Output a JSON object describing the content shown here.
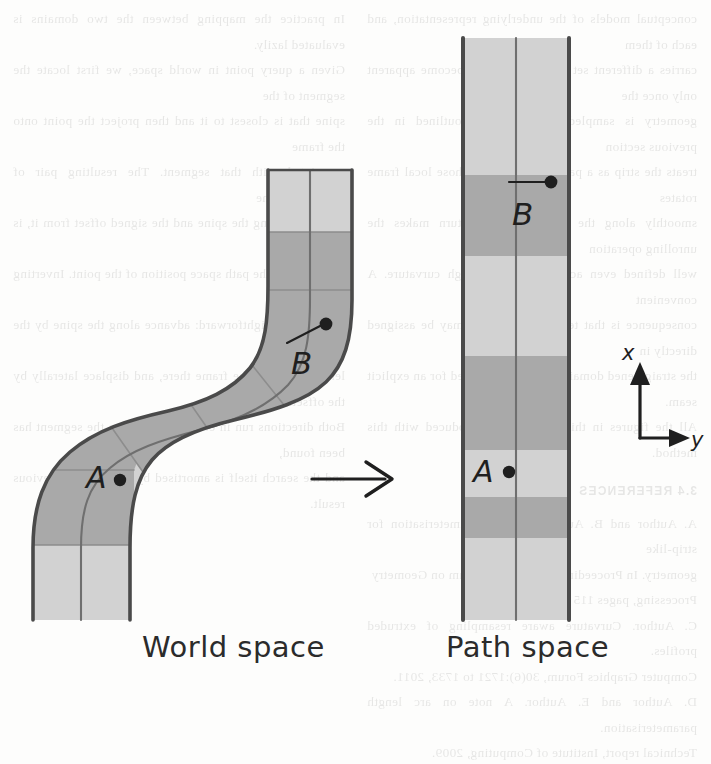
{
  "figure": {
    "title_left": "World space",
    "title_right": "Path space",
    "transform_arrow": "right-arrow",
    "axes": {
      "vertical_label": "x",
      "horizontal_label": "y"
    },
    "points": [
      {
        "id": "A",
        "label": "A",
        "space": "world",
        "x": 120,
        "y": 480
      },
      {
        "id": "B",
        "label": "B",
        "space": "world",
        "x": 325,
        "y": 324
      },
      {
        "id": "A",
        "label": "A",
        "space": "path",
        "x": 509,
        "y": 472
      },
      {
        "id": "B",
        "label": "B",
        "space": "path",
        "x": 551,
        "y": 183
      }
    ],
    "colors": {
      "band_light": "#d2d2d2",
      "band_dark": "#a9a9a9",
      "outline": "#4a4a4a",
      "centerline": "#6f6f6f",
      "ink": "#2b2b2b",
      "paper": "#fdfdfc"
    },
    "path_space": {
      "left_edge_x": 462,
      "right_edge_x": 570,
      "center_x": 516,
      "top_y": 38,
      "bottom_y": 620,
      "bands": [
        {
          "shade": "light",
          "from": 38,
          "to": 175
        },
        {
          "shade": "dark",
          "from": 175,
          "to": 256
        },
        {
          "shade": "light",
          "from": 256,
          "to": 356
        },
        {
          "shade": "dark",
          "from": 356,
          "to": 450
        },
        {
          "shade": "light",
          "from": 450,
          "to": 497
        },
        {
          "shade": "dark",
          "from": 497,
          "to": 538
        },
        {
          "shade": "light",
          "from": 538,
          "to": 620
        }
      ]
    },
    "world_space": {
      "description": "curved S-shaped ribbon with alternating light and dark segments",
      "segment_count": 7
    }
  },
  "ghost_text": {
    "left": [
      "conceptual models of the underlying representation, and each of them",
      "carries a different set of trade-offs that become apparent only once the",
      "geometry is sampled. The approach outlined in the previous section",
      "treats the strip as a parametric surface whose local frame rotates",
      "smoothly along the spine, which in turn makes the unrolling operation",
      "well defined even across regions of high curvature. A convenient",
      "consequence is that texture coordinates may be assigned directly in",
      "the straightened domain, removing the need for an explicit seam.",
      "All the figures in this chapter were produced with this method."
    ],
    "left_head": "3.4 REFERENCES",
    "left_tail": [
      "A. Author and B. Author. Surface parameterisation for strip-like",
      "  geometry. In Proceedings of the Symposium on Geometry",
      "  Processing, pages 115 to 124, 2011.",
      "C. Author. Curvature aware resampling of extruded profiles.",
      "  Computer Graphics Forum, 30(6):1721 to 1733, 2011.",
      "D. Author and E. Author. A note on arc length parameterisation.",
      "  Technical report, Institute of Computing, 2009."
    ],
    "right": [
      "In practice the mapping between the two domains is evaluated lazily.",
      "Given a query point in world space, we first locate the segment of the",
      "spine that is closest to it and then project the point onto the frame",
      "associated with that segment. The resulting pair of coordinates, the",
      "arc length along the spine and the signed offset from it, is exactly",
      "what we call the path space position of the point. Inverting the map",
      "is equally straightforward: advance along the spine by the given arc",
      "length, evaluate the frame there, and displace laterally by the offset.",
      "Both directions run in constant time once the segment has been found,",
      "and the search itself is amortised by caching the previous result."
    ]
  }
}
